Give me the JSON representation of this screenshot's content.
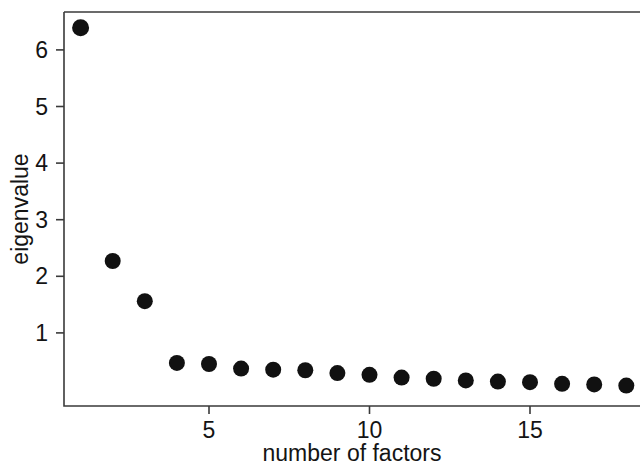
{
  "chart_data": {
    "type": "scatter",
    "title": "",
    "subtitle": "",
    "xlabel": "number of factors",
    "ylabel": "eigenvalue",
    "grid": false,
    "legend": null,
    "x": [
      1,
      2,
      3,
      4,
      5,
      6,
      7,
      8,
      9,
      10,
      11,
      12,
      13,
      14,
      15,
      16,
      17,
      18
    ],
    "values": [
      6.39,
      2.27,
      1.56,
      0.47,
      0.45,
      0.37,
      0.35,
      0.34,
      0.29,
      0.26,
      0.21,
      0.19,
      0.16,
      0.14,
      0.13,
      0.1,
      0.09,
      0.07
    ],
    "series": [
      {
        "name": "eigenvalue",
        "marker": "filled-circle",
        "color": "#111111",
        "values": [
          6.39,
          2.27,
          1.56,
          0.47,
          0.45,
          0.37,
          0.35,
          0.34,
          0.29,
          0.26,
          0.21,
          0.19,
          0.16,
          0.14,
          0.13,
          0.1,
          0.09,
          0.07
        ]
      }
    ],
    "xticks": [
      5,
      10,
      15
    ],
    "xtick_labels": [
      "5",
      "10",
      "15"
    ],
    "yticks": [
      1,
      2,
      3,
      4,
      5,
      6
    ],
    "ytick_labels": [
      "1",
      "2",
      "3",
      "4",
      "5",
      "6"
    ],
    "xlim": [
      0.2,
      18.8
    ],
    "ylim": [
      -0.1,
      6.7
    ],
    "axis_color": "#3a3a3a",
    "point_color": "#111111",
    "background": "#ffffff"
  },
  "axes": {
    "y_title": "eigenvalue",
    "x_title": "number of factors"
  }
}
